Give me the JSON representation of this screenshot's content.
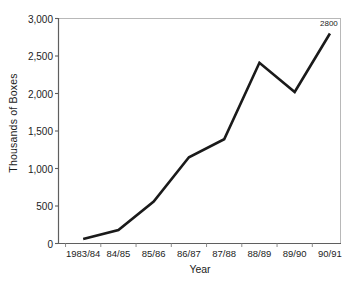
{
  "chart_data": {
    "type": "line",
    "title": "",
    "xlabel": "Year",
    "ylabel": "Thousands of Boxes",
    "categories": [
      "1983/84",
      "84/85",
      "85/86",
      "86/87",
      "87/88",
      "88/89",
      "89/90",
      "90/91"
    ],
    "values": [
      60,
      180,
      560,
      1150,
      1390,
      2410,
      2020,
      2800
    ],
    "series": [
      {
        "name": "Thousands of Boxes",
        "values": [
          60,
          180,
          560,
          1150,
          1390,
          2410,
          2020,
          2800
        ]
      }
    ],
    "ylim": [
      0,
      3000
    ],
    "ytick_values": [
      0,
      500,
      1000,
      1500,
      2000,
      2500,
      3000
    ],
    "ytick_labels": [
      "0",
      "500",
      "1,000",
      "1,500",
      "2,000",
      "2,500",
      "3,000"
    ],
    "grid": false,
    "legend": "none",
    "data_labels": [
      {
        "category": "90/91",
        "value": 2800,
        "text": "2800"
      }
    ],
    "line_color": "#1a1a1a",
    "frame_color": "#b4b4b4",
    "axis_color": "#6e6e6e",
    "background_color": "#ffffff"
  }
}
